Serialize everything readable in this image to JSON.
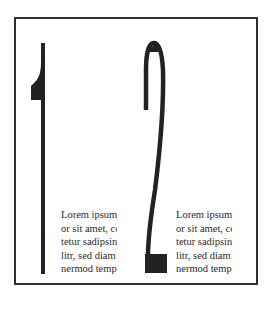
{
  "page": {
    "numerals": [
      "1",
      "2"
    ],
    "colors": {
      "ink": "#222222",
      "frame": "#2e2e2e",
      "text": "#2a2a2a",
      "background": "#ffffff"
    },
    "columns": [
      {
        "lines": [
          "Lorem ipsum",
          "or sit amet, co",
          "tetur sadipsing",
          "litr, sed diam",
          "nermod tempo"
        ]
      },
      {
        "lines": [
          "Lorem ipsum",
          "or sit amet, co",
          "tetur sadipsing",
          "litr, sed diam",
          "nermod tempo"
        ]
      }
    ]
  }
}
